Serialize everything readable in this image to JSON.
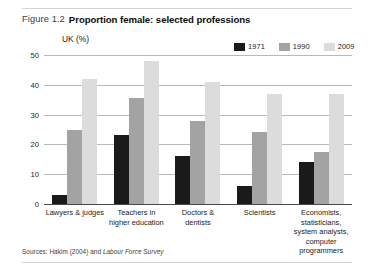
{
  "figure": {
    "number": "Figure 1.2",
    "title": "Proportion female: selected professions",
    "subtitle": "UK (%)",
    "source_prefix": "Sources: Hakim (2004) and ",
    "source_italic": "Labour Force Survey"
  },
  "legend": {
    "items": [
      {
        "label": "1971",
        "color": "#1a1a1a"
      },
      {
        "label": "1990",
        "color": "#a3a3a3"
      },
      {
        "label": "2009",
        "color": "#dcdcdc"
      }
    ]
  },
  "axis": {
    "yticks": [
      "0",
      "10",
      "20",
      "30",
      "40",
      "50"
    ]
  },
  "chart_data": {
    "type": "bar",
    "title": "Proportion female: selected professions",
    "subtitle": "UK (%)",
    "xlabel": "",
    "ylabel": "UK (%)",
    "ylim": [
      0,
      50
    ],
    "ytick_values": [
      0,
      10,
      20,
      30,
      40,
      50
    ],
    "grid": true,
    "legend_position": "top-right",
    "categories": [
      "Lawyers & judges",
      "Teachers in higher education",
      "Doctors & dentists",
      "Scientists",
      "Economists, statisticians, system analysts, computer programmers"
    ],
    "series": [
      {
        "name": "1971",
        "color": "#1a1a1a",
        "values": [
          3,
          23,
          16,
          6,
          14
        ]
      },
      {
        "name": "1990",
        "color": "#a3a3a3",
        "values": [
          25,
          35.5,
          28,
          24,
          17.5
        ]
      },
      {
        "name": "2009",
        "color": "#dcdcdc",
        "values": [
          42,
          48,
          41,
          37,
          37
        ]
      }
    ]
  }
}
